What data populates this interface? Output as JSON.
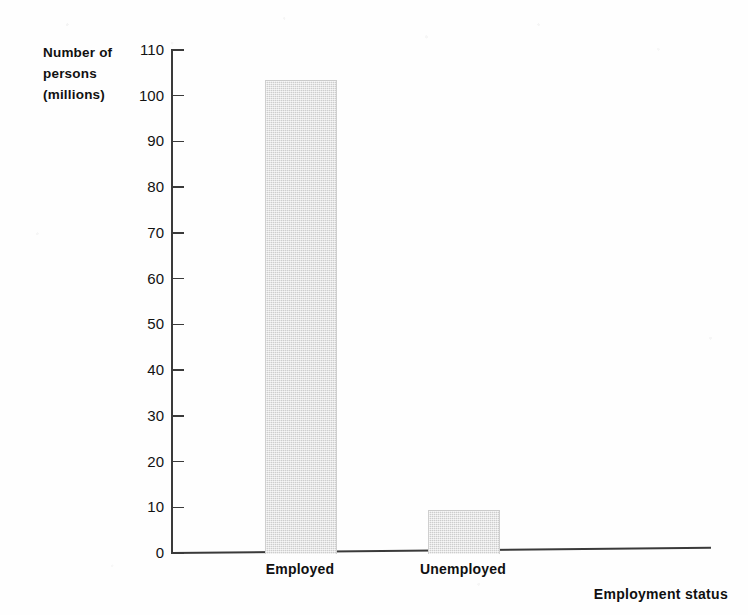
{
  "chart_data": {
    "type": "bar",
    "title": "",
    "categories": [
      "Employed",
      "Unemployed"
    ],
    "values": [
      103.5,
      9.5
    ],
    "xlabel": "Employment status",
    "ylabel": "Number of persons (millions)",
    "ylabel_lines": [
      "Number of",
      "persons",
      "(millions)"
    ],
    "ylim": [
      0,
      110
    ],
    "ytick_step": 10,
    "yticks": [
      0,
      10,
      20,
      30,
      40,
      50,
      60,
      70,
      80,
      90,
      100,
      110
    ],
    "ytick_labels": [
      "0",
      "10",
      "20",
      "30",
      "40",
      "50",
      "60",
      "70",
      "80",
      "90",
      "100",
      "110"
    ],
    "grid": false,
    "legend": false,
    "bar_color": "#dcdcdc",
    "axis_color": "#3a3a3a",
    "background_color": "#fefefe"
  }
}
